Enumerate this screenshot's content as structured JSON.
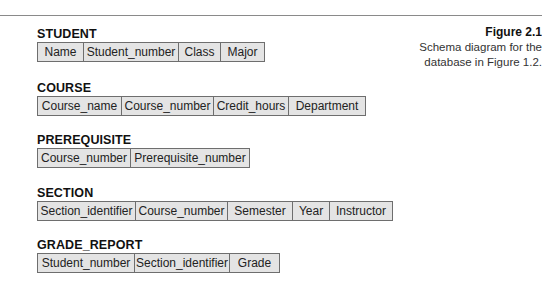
{
  "caption": {
    "figure_label": "Figure 2.1",
    "line1": "Schema diagram for the",
    "line2": "database in Figure 1.2."
  },
  "relations": [
    {
      "name": "STUDENT",
      "attributes": [
        "Name",
        "Student_number",
        "Class",
        "Major"
      ],
      "widths": [
        46,
        95,
        42,
        43
      ],
      "top": 27
    },
    {
      "name": "COURSE",
      "attributes": [
        "Course_name",
        "Course_number",
        "Credit_hours",
        "Department"
      ],
      "widths": [
        84,
        92,
        75,
        76
      ],
      "top": 81
    },
    {
      "name": "PREREQUISITE",
      "attributes": [
        "Course_number",
        "Prerequisite_number"
      ],
      "widths": [
        93,
        118
      ],
      "top": 133
    },
    {
      "name": "SECTION",
      "attributes": [
        "Section_identifier",
        "Course_number",
        "Semester",
        "Year",
        "Instructor"
      ],
      "widths": [
        98,
        92,
        65,
        37,
        62
      ],
      "top": 186
    },
    {
      "name": "GRADE_REPORT",
      "attributes": [
        "Student_number",
        "Section_identifier",
        "Grade"
      ],
      "widths": [
        97,
        95,
        49
      ],
      "top": 238
    }
  ]
}
